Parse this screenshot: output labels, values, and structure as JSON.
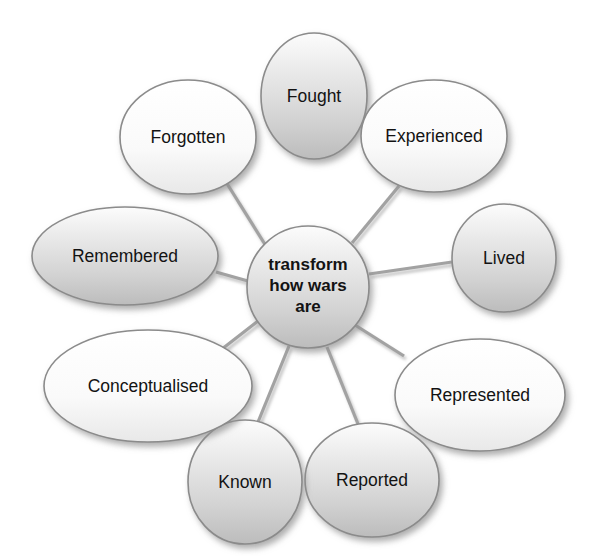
{
  "diagram": {
    "type": "radial-hub-and-spoke",
    "center": {
      "id": "center",
      "label_lines": [
        "transform",
        "how wars",
        "are"
      ],
      "label": "transform how wars are",
      "shape": "circle",
      "fill_style": "shaded",
      "cx": 308,
      "cy": 287,
      "rx": 61,
      "ry": 61
    },
    "nodes": [
      {
        "id": "fought",
        "label": "Fought",
        "shape": "circle",
        "fill_style": "shaded",
        "cx": 314,
        "cy": 96,
        "rx": 53,
        "ry": 63,
        "angle_deg": 270
      },
      {
        "id": "experienced",
        "label": "Experienced",
        "shape": "ellipse",
        "fill_style": "light",
        "cx": 434,
        "cy": 136,
        "rx": 73,
        "ry": 56,
        "angle_deg": 315
      },
      {
        "id": "lived",
        "label": "Lived",
        "shape": "circle",
        "fill_style": "shaded",
        "cx": 504,
        "cy": 258,
        "rx": 52,
        "ry": 54,
        "angle_deg": 0
      },
      {
        "id": "represented",
        "label": "Represented",
        "shape": "ellipse",
        "fill_style": "light",
        "cx": 480,
        "cy": 395,
        "rx": 85,
        "ry": 56,
        "angle_deg": 45
      },
      {
        "id": "reported",
        "label": "Reported",
        "shape": "ellipse",
        "fill_style": "shaded",
        "cx": 372,
        "cy": 480,
        "rx": 67,
        "ry": 57,
        "angle_deg": 80
      },
      {
        "id": "known",
        "label": "Known",
        "shape": "ellipse",
        "fill_style": "shaded",
        "cx": 245,
        "cy": 482,
        "rx": 57,
        "ry": 62,
        "angle_deg": 105
      },
      {
        "id": "conceptualised",
        "label": "Conceptualised",
        "shape": "ellipse",
        "fill_style": "light",
        "cx": 148,
        "cy": 386,
        "rx": 104,
        "ry": 56,
        "angle_deg": 145
      },
      {
        "id": "remembered",
        "label": "Remembered",
        "shape": "ellipse",
        "fill_style": "shaded",
        "cx": 125,
        "cy": 256,
        "rx": 93,
        "ry": 49,
        "angle_deg": 185
      },
      {
        "id": "forgotten",
        "label": "Forgotten",
        "shape": "ellipse",
        "fill_style": "light",
        "cx": 188,
        "cy": 137,
        "rx": 68,
        "ry": 57,
        "angle_deg": 225
      }
    ],
    "connectors": [
      {
        "from": "center",
        "to": "fought",
        "x1": 314,
        "y1": 228,
        "x2": 314,
        "y2": 159
      },
      {
        "from": "center",
        "to": "experienced",
        "x1": 352,
        "y1": 243,
        "x2": 399,
        "y2": 186
      },
      {
        "from": "center",
        "to": "lived",
        "x1": 369,
        "y1": 274,
        "x2": 452,
        "y2": 262
      },
      {
        "from": "center",
        "to": "represented",
        "x1": 355,
        "y1": 325,
        "x2": 404,
        "y2": 356
      },
      {
        "from": "center",
        "to": "reported",
        "x1": 327,
        "y1": 347,
        "x2": 358,
        "y2": 424
      },
      {
        "from": "center",
        "to": "known",
        "x1": 289,
        "y1": 346,
        "x2": 258,
        "y2": 422
      },
      {
        "from": "center",
        "to": "conceptualised",
        "x1": 258,
        "y1": 321,
        "x2": 222,
        "y2": 349
      },
      {
        "from": "center",
        "to": "remembered",
        "x1": 248,
        "y1": 281,
        "x2": 216,
        "y2": 272
      },
      {
        "from": "center",
        "to": "forgotten",
        "x1": 266,
        "y1": 246,
        "x2": 226,
        "y2": 182
      }
    ]
  },
  "colors": {
    "background": "#ffffff",
    "shaded_fill_top": "#fcfcfc",
    "shaded_fill_bottom": "#bcbcbc",
    "light_fill_top": "#ffffff",
    "light_fill_bottom": "#ededed",
    "node_outline": "#8b8b8b",
    "connector": "#a2a2a2",
    "text": "#131313",
    "shadow": "#8e8e8e"
  }
}
